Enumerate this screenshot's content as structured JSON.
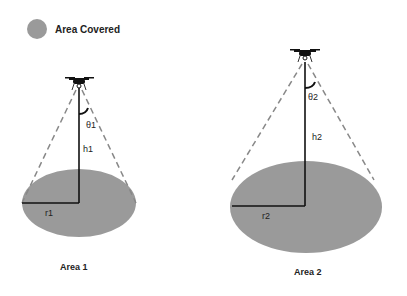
{
  "legend": {
    "label": "Area Covered",
    "swatch_color": "#9a9a9a"
  },
  "scenario1": {
    "angle_label": "θ1",
    "height_label": "h1",
    "radius_label": "r1",
    "area_label": "Area 1"
  },
  "scenario2": {
    "angle_label": "θ2",
    "height_label": "h2",
    "radius_label": "r2",
    "area_label": "Area 2"
  },
  "colors": {
    "area_fill": "#9a9a9a",
    "line": "#111111",
    "dash": "#888888"
  }
}
